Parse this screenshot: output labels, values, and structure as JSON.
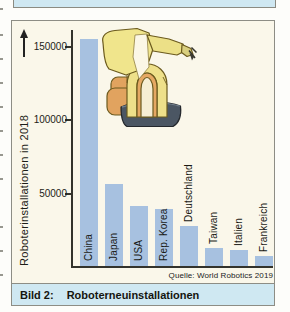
{
  "figure": {
    "caption": {
      "label": "Bild 2:",
      "title": "Roboterneuinstallationen"
    },
    "source": "Quelle: World Robotics 2019"
  },
  "chart_data": {
    "type": "bar",
    "title": "",
    "xlabel": "",
    "ylabel": "Roboterinstallationen in 2018",
    "categories": [
      "China",
      "Japan",
      "USA",
      "Rep. Korea",
      "Deutschland",
      "Taiwan",
      "Italien",
      "Frankreich"
    ],
    "values": [
      155000,
      56000,
      41000,
      39000,
      27000,
      12500,
      11000,
      6500
    ],
    "yticks": [
      50000,
      100000,
      150000
    ],
    "ylim": [
      0,
      162000
    ],
    "grid": false,
    "legend": "none",
    "bar_color": "#a7c1e0",
    "source": "Quelle: World Robotics 2019",
    "illustration": "industrial-robot-arm"
  },
  "colors": {
    "box_background": "#faf7ea",
    "caption_background": "#cfe8f2",
    "bar": "#a7c1e0",
    "border": "#8d8d85",
    "axis": "#33332c",
    "text": "#1d1d17"
  }
}
